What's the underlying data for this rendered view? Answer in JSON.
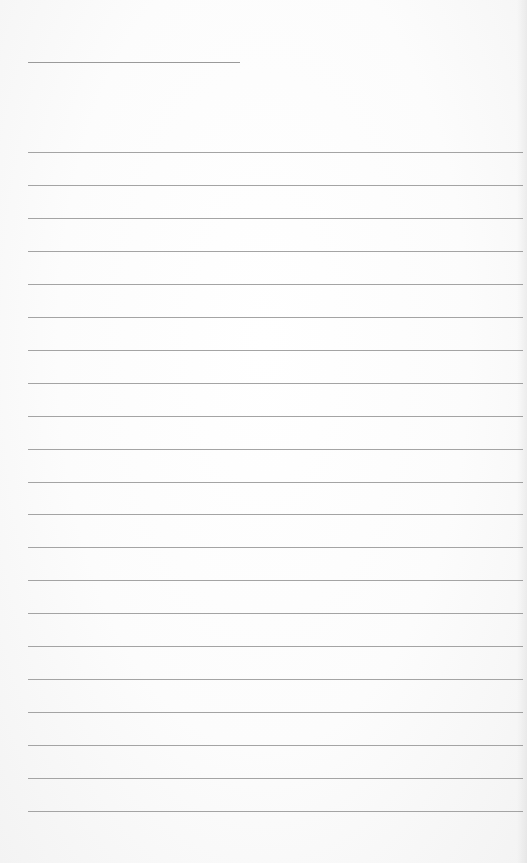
{
  "document": {
    "type": "lined-paper",
    "title_line": {
      "filled_text": ""
    },
    "ruled_lines": [
      {
        "index": 1,
        "text": ""
      },
      {
        "index": 2,
        "text": ""
      },
      {
        "index": 3,
        "text": ""
      },
      {
        "index": 4,
        "text": ""
      },
      {
        "index": 5,
        "text": ""
      },
      {
        "index": 6,
        "text": ""
      },
      {
        "index": 7,
        "text": ""
      },
      {
        "index": 8,
        "text": ""
      },
      {
        "index": 9,
        "text": ""
      },
      {
        "index": 10,
        "text": ""
      },
      {
        "index": 11,
        "text": ""
      },
      {
        "index": 12,
        "text": ""
      },
      {
        "index": 13,
        "text": ""
      },
      {
        "index": 14,
        "text": ""
      },
      {
        "index": 15,
        "text": ""
      },
      {
        "index": 16,
        "text": ""
      },
      {
        "index": 17,
        "text": ""
      },
      {
        "index": 18,
        "text": ""
      },
      {
        "index": 19,
        "text": ""
      },
      {
        "index": 20,
        "text": ""
      },
      {
        "index": 21,
        "text": ""
      }
    ],
    "colors": {
      "paper": "#ffffff",
      "rule": "#a4a4a4"
    }
  }
}
